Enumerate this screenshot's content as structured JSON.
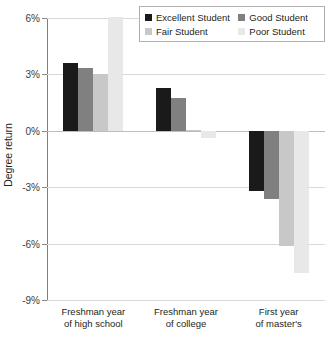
{
  "chart_data": {
    "type": "bar",
    "title": "",
    "xlabel": "",
    "ylabel": "Degree return",
    "ylim": [
      -9,
      6
    ],
    "yticks": [
      6,
      3,
      0,
      -3,
      -6,
      -9
    ],
    "ytick_labels": [
      "6%",
      "3%",
      "0%",
      "-3%",
      "-6%",
      "-9%"
    ],
    "grid": true,
    "legend_position": "top-right",
    "categories": [
      "Freshman year\nof high school",
      "Freshman year\nof college",
      "First year\nof master's"
    ],
    "series": [
      {
        "name": "Excellent Student",
        "color": "#1a1a1a",
        "values": [
          3.6,
          2.3,
          -3.2
        ]
      },
      {
        "name": "Good Student",
        "color": "#808080",
        "values": [
          3.35,
          1.75,
          -3.65
        ]
      },
      {
        "name": "Fair Student",
        "color": "#c8c8c8",
        "values": [
          3.0,
          0.05,
          -6.15
        ]
      },
      {
        "name": "Poor Student",
        "color": "#e8e8e8",
        "values": [
          6.05,
          -0.4,
          -7.55
        ]
      }
    ]
  }
}
